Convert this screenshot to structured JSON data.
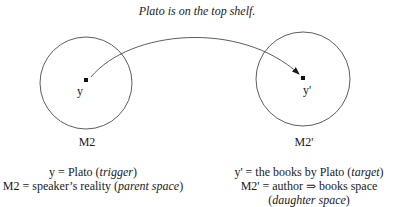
{
  "title": "Plato is on the top shelf.",
  "colors": {
    "stroke": "#333333",
    "text": "#1a1a1a",
    "background": "#ffffff"
  },
  "spaces": [
    {
      "id": "M2",
      "label": "M2",
      "element": "y",
      "legend": {
        "line1": {
          "text": "y = Plato (",
          "italic": "trigger",
          "close": ")"
        },
        "line2": {
          "text": "M2 = speaker’s reality (",
          "italic": "parent space",
          "close": ")"
        }
      }
    },
    {
      "id": "M2prime",
      "label": "M2'",
      "element": "y'",
      "legend": {
        "line1": {
          "text": "y' = the books by Plato (",
          "italic": "target",
          "close": ")"
        },
        "line2": {
          "text": "M2' = author ⇒ books space"
        },
        "line3": {
          "open": "(",
          "italic": "daughter space",
          "close": ")"
        }
      }
    }
  ],
  "connector": {
    "from": "y",
    "to": "y'",
    "type": "curved-arrow"
  }
}
